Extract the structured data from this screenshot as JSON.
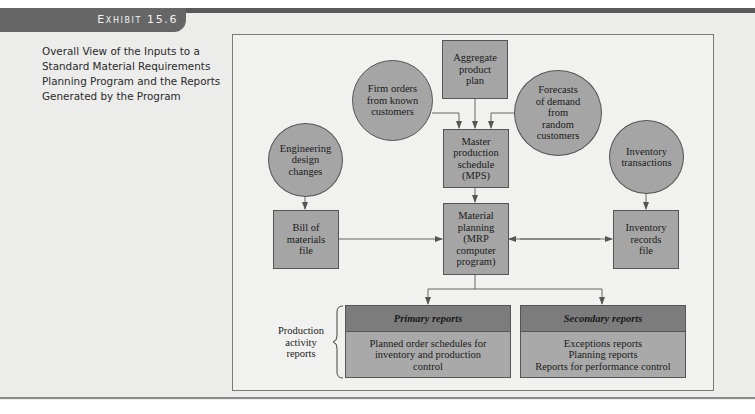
{
  "header": {
    "exhibit_label": "Exhibit 15.6",
    "caption": "Overall View of the Inputs to a Standard Material Requirements Planning Program and the Reports Generated by the Program"
  },
  "diagram": {
    "nodes": {
      "aggregate_plan": "Aggregate\nproduct\nplan",
      "firm_orders": "Firm orders\nfrom known\ncustomers",
      "forecasts": "Forecasts\nof demand\nfrom\nrandom\ncustomers",
      "engineering_changes": "Engineering\ndesign\nchanges",
      "mps": "Master\nproduction\nschedule\n(MPS)",
      "inventory_transactions": "Inventory\ntransactions",
      "bill_of_materials": "Bill of\nmaterials\nfile",
      "mrp_program": "Material\nplanning\n(MRP\ncomputer\nprogram)",
      "inventory_records": "Inventory\nrecords\nfile"
    },
    "reports_group_label": "Production\nactivity\nreports",
    "primary_reports": {
      "title": "Primary reports",
      "body": "Planned order schedules for\ninventory and production\ncontrol"
    },
    "secondary_reports": {
      "title": "Secondary reports",
      "body": "Exceptions reports\nPlanning reports\nReports for performance control"
    },
    "colors": {
      "node_fill": "#a5a5a5",
      "report_header_fill": "#7c7c7c",
      "frame_bg": "#f1f1ef",
      "line": "#555555"
    }
  }
}
